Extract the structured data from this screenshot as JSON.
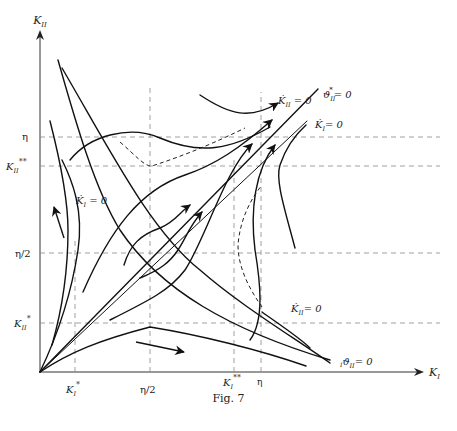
{
  "figure": {
    "caption": "Fig. 7",
    "axes": {
      "x_label": "K",
      "x_label_sub": "I",
      "y_label": "K",
      "y_label_sub": "II"
    },
    "x_ticks": [
      {
        "id": "K1_star",
        "main": "K",
        "sub": "I",
        "sup": "*"
      },
      {
        "id": "eta_half_x",
        "main": "η/2"
      },
      {
        "id": "K1_starstar",
        "main": "K",
        "sub": "I",
        "sup": "**"
      },
      {
        "id": "eta_x",
        "main": "η"
      }
    ],
    "y_ticks": [
      {
        "id": "eta_y",
        "main": "η"
      },
      {
        "id": "K2_starstar",
        "main": "K",
        "sub": "II",
        "sup": "**"
      },
      {
        "id": "eta_half_y",
        "main": "η/2"
      },
      {
        "id": "K2_star",
        "main": "K",
        "sub": "II",
        "sup": "*"
      }
    ],
    "curve_labels": {
      "k2dot_top": {
        "main": "K̇",
        "sub": "II",
        "rest": " = 0"
      },
      "theta2star": {
        "main": "ϑ",
        "sub": "II",
        "sup": "*",
        "rest": "= 0"
      },
      "k1dot_right": {
        "main": "K̇",
        "sub": "I",
        "rest": "=  0"
      },
      "k1dot_left": {
        "main": "K̇",
        "sub": "I",
        "rest": " = 0"
      },
      "k2dot_bottom": {
        "main": "K̇",
        "sub": "II",
        "rest": "= 0"
      },
      "theta2_bottom": {
        "main": "ϑ",
        "pre_sub": "I",
        "sub": "II",
        "rest": "= 0"
      }
    }
  }
}
